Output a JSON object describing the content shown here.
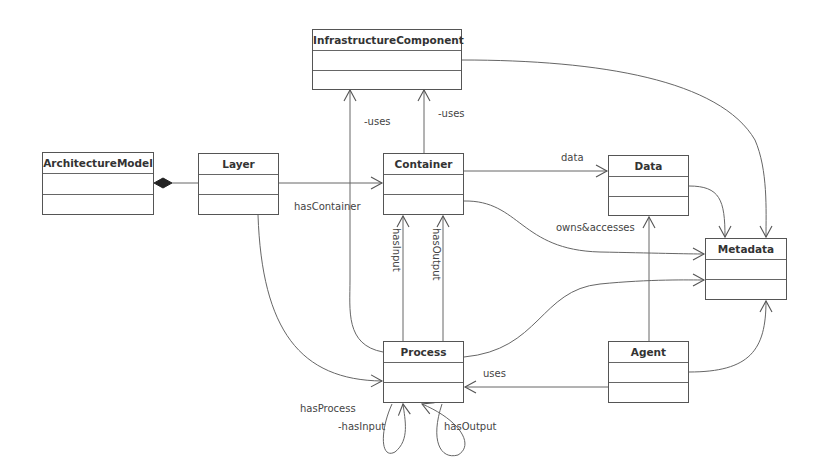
{
  "diagram": {
    "type": "UML class diagram",
    "classes": [
      {
        "id": "infrastructure-component",
        "name": "InfrastructureComponent",
        "x": 312,
        "y": 29,
        "w": 150,
        "h": 61
      },
      {
        "id": "architecture-model",
        "name": "ArchitectureModel",
        "x": 42,
        "y": 152,
        "w": 112,
        "h": 63
      },
      {
        "id": "layer",
        "name": "Layer",
        "x": 198,
        "y": 153,
        "w": 81,
        "h": 62
      },
      {
        "id": "container",
        "name": "Container",
        "x": 383,
        "y": 153,
        "w": 81,
        "h": 62
      },
      {
        "id": "data",
        "name": "Data",
        "x": 608,
        "y": 155,
        "w": 81,
        "h": 61
      },
      {
        "id": "metadata",
        "name": "Metadata",
        "x": 705,
        "y": 238,
        "w": 82,
        "h": 62
      },
      {
        "id": "process",
        "name": "Process",
        "x": 383,
        "y": 341,
        "w": 81,
        "h": 62
      },
      {
        "id": "agent",
        "name": "Agent",
        "x": 608,
        "y": 341,
        "w": 81,
        "h": 62
      }
    ],
    "relations": [
      {
        "from": "ArchitectureModel",
        "to": "Layer",
        "kind": "composition",
        "label": ""
      },
      {
        "from": "Layer",
        "to": "Container",
        "kind": "association",
        "label": "hasContainer"
      },
      {
        "from": "Layer",
        "to": "Process",
        "kind": "association",
        "label": "hasProcess"
      },
      {
        "from": "Container",
        "to": "InfrastructureComponent",
        "kind": "association",
        "label": "-uses"
      },
      {
        "from": "Process",
        "to": "InfrastructureComponent",
        "kind": "association",
        "label": "-uses"
      },
      {
        "from": "Container",
        "to": "Data",
        "kind": "association",
        "label": "data"
      },
      {
        "from": "Container",
        "to": "Metadata",
        "kind": "association",
        "label": "owns&accesses"
      },
      {
        "from": "Process",
        "to": "Container",
        "kind": "association",
        "label": "hasInput"
      },
      {
        "from": "Process",
        "to": "Container",
        "kind": "association",
        "label": "hasOutput"
      },
      {
        "from": "Process",
        "to": "Process",
        "kind": "self-association",
        "label": "-hasInput"
      },
      {
        "from": "Process",
        "to": "Process",
        "kind": "self-association",
        "label": "hasOutput"
      },
      {
        "from": "Agent",
        "to": "Process",
        "kind": "association",
        "label": "uses"
      },
      {
        "from": "Agent",
        "to": "Data",
        "kind": "association",
        "label": ""
      },
      {
        "from": "Agent",
        "to": "Metadata",
        "kind": "association",
        "label": ""
      },
      {
        "from": "Data",
        "to": "Metadata",
        "kind": "association",
        "label": ""
      },
      {
        "from": "InfrastructureComponent",
        "to": "Metadata",
        "kind": "association",
        "label": ""
      },
      {
        "from": "Process",
        "to": "Metadata",
        "kind": "association",
        "label": ""
      }
    ]
  },
  "labels": {
    "uses_left": "-uses",
    "uses_right": "-uses",
    "has_container": "hasContainer",
    "data": "data",
    "owns_accesses": "owns&accesses",
    "has_input": "hasInput",
    "has_output": "hasOutput",
    "uses_agent": "uses",
    "has_process": "hasProcess",
    "self_has_input": "-hasInput",
    "self_has_output": "hasOutput"
  }
}
